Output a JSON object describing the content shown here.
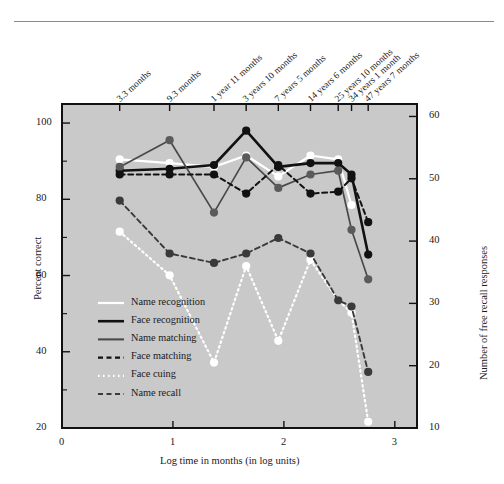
{
  "chart_data": {
    "type": "line",
    "title": "",
    "xlabel": "Log time in months (in log units)",
    "ylabel": "Percent correct",
    "y2label": "Number of free recall responses",
    "xlim": [
      0,
      3.2
    ],
    "ylim": [
      20,
      105
    ],
    "y2lim": [
      10,
      62
    ],
    "xticks": [
      0,
      1,
      2,
      3
    ],
    "yticks": [
      20,
      40,
      60,
      80,
      100
    ],
    "yticks_minor": [
      30,
      50,
      70,
      90
    ],
    "y2ticks": [
      10,
      20,
      30,
      40,
      50,
      60
    ],
    "grid": false,
    "legend_position": "lower-left-inside",
    "top_axis_labels": [
      "3.3 months",
      "9.3 months",
      "1 year 11 months",
      "3 years 10 months",
      "7 years 5 months",
      "14 years 6 months",
      "25 years 10 months",
      "34 years 1 month",
      "47 years 7 months"
    ],
    "x": [
      0.52,
      0.97,
      1.37,
      1.66,
      1.95,
      2.24,
      2.49,
      2.61,
      2.76
    ],
    "series": [
      {
        "name": "Name recognition",
        "color": "#ffffff",
        "style": "solid",
        "width": 2.2,
        "marker": "circle-white",
        "axis": "left",
        "values": [
          90.5,
          89.5,
          88.5,
          91.5,
          86.0,
          91.5,
          90.5,
          78.5,
          null
        ]
      },
      {
        "name": "Face recognition",
        "color": "#111111",
        "style": "solid",
        "width": 2.6,
        "marker": "circle-black",
        "axis": "left",
        "values": [
          87.5,
          88.0,
          89.0,
          98.0,
          88.5,
          89.5,
          89.5,
          86.5,
          65.5
        ]
      },
      {
        "name": "Name matching",
        "color": "#4a4a4a",
        "style": "solid",
        "width": 1.7,
        "marker": "circle-gray",
        "axis": "left",
        "values": [
          88.5,
          95.5,
          76.5,
          91.0,
          83.0,
          86.5,
          87.5,
          72.0,
          59.0
        ]
      },
      {
        "name": "Face matching",
        "color": "#111111",
        "style": "dashed",
        "width": 2.0,
        "marker": "circle-black",
        "axis": "left",
        "values": [
          86.5,
          86.5,
          86.5,
          81.5,
          89.0,
          81.5,
          82.0,
          85.5,
          74.0
        ]
      },
      {
        "name": "Face cuing",
        "color": "#ffffff",
        "style": "dotted",
        "width": 2.2,
        "marker": "circle-white",
        "axis": "right",
        "values": [
          41.5,
          34.5,
          20.5,
          36.0,
          24.0,
          37.0,
          30.5,
          28.5,
          11.0
        ]
      },
      {
        "name": "Name recall",
        "color": "#3a3a3a",
        "style": "dashed",
        "width": 1.9,
        "marker": "circle-darkgray",
        "axis": "right",
        "values": [
          46.5,
          38.0,
          36.5,
          38.0,
          40.5,
          38.0,
          30.5,
          29.5,
          19.0
        ]
      }
    ]
  },
  "legend": {
    "items": [
      {
        "label": "Name recognition"
      },
      {
        "label": "Face recognition"
      },
      {
        "label": "Name matching"
      },
      {
        "label": "Face matching"
      },
      {
        "label": "Face cuing"
      },
      {
        "label": "Name recall"
      }
    ]
  },
  "axes": {
    "x_title": "Log time in months (in log units)",
    "y_left_title": "Percent correct",
    "y_right_title": "Number of free recall responses",
    "x_ticks": [
      "0",
      "1",
      "2",
      "3"
    ],
    "y_left_ticks": [
      "100",
      "80",
      "60",
      "40",
      "20"
    ],
    "y_right_ticks": [
      "60",
      "50",
      "40",
      "30",
      "20",
      "10"
    ]
  },
  "colors": {
    "plot_background": "#c9c9c9",
    "page_background": "#ffffff",
    "axis": "#111111",
    "text": "#1a1a1a"
  }
}
